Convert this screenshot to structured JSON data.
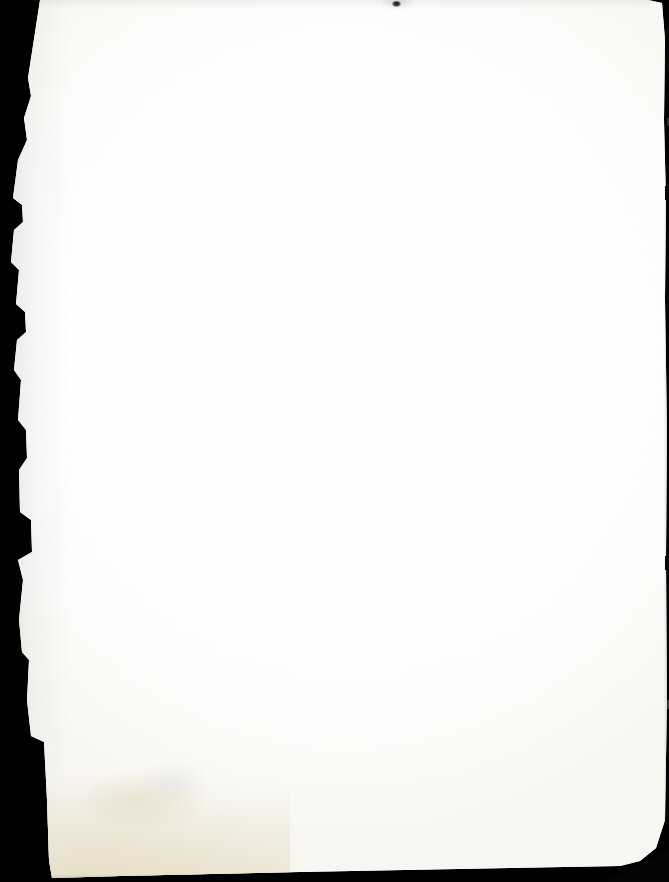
{
  "document": {
    "kind": "scanned-page",
    "page_state": "blank",
    "page_text": "",
    "visible_text_lines": [],
    "width_px": 669,
    "height_px": 882
  },
  "colors": {
    "scanner_backdrop": "#010101",
    "paper_white": "#fdfdfc",
    "paper_highlight": "#ffffff",
    "paper_shade": "#f8f7f3",
    "stain_warm": "#e8dec7",
    "stain_deep": "#dbcfb1",
    "edge_dark": "#060606"
  },
  "artifacts": {
    "left_edge": {
      "name": "torn-left-edge",
      "description": "ragged black scanner backdrop along the left margin"
    },
    "top_left_corner": {
      "name": "angled-top-left-corner",
      "description": "diagonal black wedge cutting the top-left corner"
    },
    "top_speck": {
      "name": "top-edge-speck",
      "description": "small dark speck at the top center edge"
    },
    "right_edge": {
      "name": "right-edge-nicks",
      "description": "thin dark strip with small nicks along the right margin"
    },
    "bottom_right_corner": {
      "name": "bottom-right-corner-wedge",
      "description": "dark triangular corner at the bottom right"
    },
    "bottom_left_stain": {
      "name": "bottom-left-stain",
      "description": "warm beige age and water staining rising from the bottom-left"
    }
  }
}
